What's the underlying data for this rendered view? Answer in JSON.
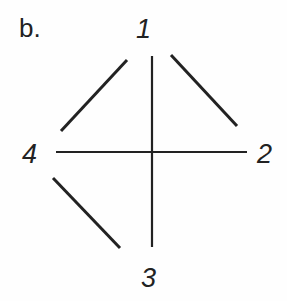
{
  "panel_label": "b.",
  "nodes": [
    {
      "id": "1",
      "label": "1"
    },
    {
      "id": "2",
      "label": "2"
    },
    {
      "id": "3",
      "label": "3"
    },
    {
      "id": "4",
      "label": "4"
    }
  ],
  "edges": [
    {
      "from": "1",
      "to": "4"
    },
    {
      "from": "1",
      "to": "2"
    },
    {
      "from": "1",
      "to": "3"
    },
    {
      "from": "4",
      "to": "2"
    },
    {
      "from": "4",
      "to": "3"
    }
  ],
  "colors": {
    "stroke": "#222222",
    "background": "#fefefe"
  }
}
